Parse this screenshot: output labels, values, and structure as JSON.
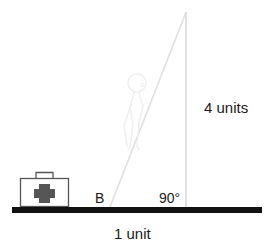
{
  "figure": {
    "kind": "right-triangle-geometry-diagram",
    "background_color": "#ffffff",
    "ink_color": "#1a1a1a"
  },
  "labels": {
    "vertical_side": "4 units",
    "horizontal_side": "1 unit",
    "right_angle": "90°",
    "base_point": "B"
  },
  "elements": {
    "ground_line_name": "ground-line",
    "vertical_line_name": "vertical-line",
    "hypotenuse_name": "hypotenuse-line",
    "first_aid_kit_name": "first-aid-kit",
    "person_name": "person-figure"
  },
  "colors": {
    "ground": "#111111",
    "kit_outline": "#555555",
    "kit_cross": "#555555",
    "faint_line": "#e2e2e2",
    "vertical_line": "#d8d8d8",
    "person": "#efefef"
  },
  "geometry": {
    "apex_x": 186,
    "apex_y": 12,
    "base_right_x": 186,
    "base_y": 207,
    "base_left_x": 110,
    "ground_x1": 12,
    "ground_x2": 262
  }
}
